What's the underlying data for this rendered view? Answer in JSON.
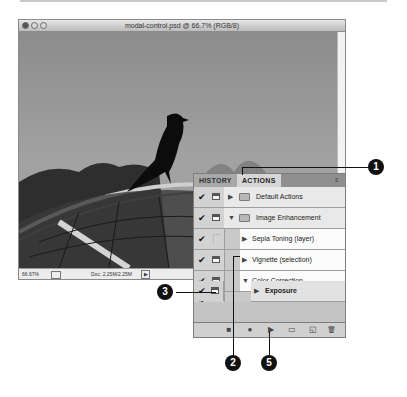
{
  "window": {
    "title": "modal-control.psd @ 66.7% (RGB/8)",
    "zoom_field": "66.67%",
    "doc_info": "Doc: 2.25M/2.25M"
  },
  "panel": {
    "tabs": [
      {
        "label": "HISTORY",
        "active": false
      },
      {
        "label": "ACTIONS",
        "active": true
      }
    ],
    "menu_icon": "≡",
    "rows": [
      {
        "label": "Default Actions",
        "checked": true,
        "dialog": true,
        "expanded": false,
        "type": "set",
        "indent": 0
      },
      {
        "label": "Image Enhancement",
        "checked": true,
        "dialog": true,
        "expanded": true,
        "type": "set",
        "indent": 0
      },
      {
        "label": "Sepia Toning (layer)",
        "checked": true,
        "dialog": false,
        "expanded": false,
        "type": "action",
        "indent": 1
      },
      {
        "label": "Vignette (selection)",
        "checked": true,
        "dialog": true,
        "expanded": false,
        "type": "action",
        "indent": 1
      },
      {
        "label": "Color Correction",
        "checked": true,
        "dialog": true,
        "expanded": true,
        "type": "action",
        "indent": 1
      },
      {
        "label": "Levels",
        "checked": true,
        "dialog": false,
        "expanded": false,
        "type": "command",
        "indent": 2
      },
      {
        "label": "Match Color",
        "checked": true,
        "dialog": false,
        "expanded": false,
        "type": "command",
        "indent": 2
      },
      {
        "label": "Exposure",
        "checked": true,
        "dialog": true,
        "expanded": false,
        "type": "command",
        "indent": 2,
        "selected": true
      }
    ],
    "footer_buttons": [
      {
        "name": "stop-button",
        "glyph": "■"
      },
      {
        "name": "record-button",
        "glyph": "●"
      },
      {
        "name": "play-button",
        "glyph": "▶"
      },
      {
        "name": "new-set-button",
        "glyph": "▭"
      },
      {
        "name": "new-action-button",
        "glyph": "◱"
      },
      {
        "name": "delete-button",
        "glyph": "🗑"
      }
    ]
  },
  "callouts": [
    "1",
    "2",
    "3",
    "5"
  ]
}
